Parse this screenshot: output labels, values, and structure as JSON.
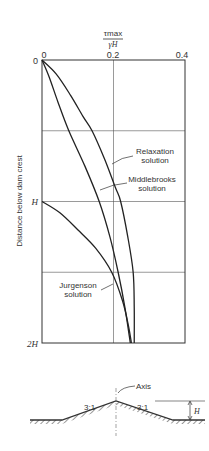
{
  "chart_data": {
    "type": "line",
    "title": "",
    "xlabel_numerator": "τmax",
    "xlabel_denominator": "γH",
    "ylabel": "Distance below dam crest",
    "xlim": [
      0,
      0.4
    ],
    "ylim": [
      0,
      2
    ],
    "y_unit": "H",
    "x_ticks": [
      "0",
      "0.2",
      "0.4"
    ],
    "y_ticks": [
      "0",
      "H",
      "2H"
    ],
    "grid": true,
    "series": [
      {
        "name": "Relaxation solution",
        "label_lines": [
          "Relaxation",
          "solution"
        ],
        "points": [
          [
            0,
            0
          ],
          [
            0.04,
            0.1
          ],
          [
            0.08,
            0.25
          ],
          [
            0.115,
            0.4
          ],
          [
            0.14,
            0.5
          ],
          [
            0.175,
            0.7
          ],
          [
            0.205,
            0.9
          ],
          [
            0.22,
            1.0
          ],
          [
            0.24,
            1.25
          ],
          [
            0.255,
            1.5
          ],
          [
            0.258,
            1.75
          ],
          [
            0.258,
            2.0
          ]
        ]
      },
      {
        "name": "Middlebrooks solution",
        "label_lines": [
          "Middlebrooks",
          "solution"
        ],
        "points": [
          [
            0,
            0
          ],
          [
            0.02,
            0.12
          ],
          [
            0.045,
            0.3
          ],
          [
            0.075,
            0.5
          ],
          [
            0.12,
            0.75
          ],
          [
            0.16,
            1.0
          ],
          [
            0.19,
            1.25
          ],
          [
            0.213,
            1.5
          ],
          [
            0.232,
            1.75
          ],
          [
            0.247,
            2.0
          ]
        ]
      },
      {
        "name": "Jurgenson solution",
        "label_lines": [
          "Jurgenson",
          "solution"
        ],
        "points": [
          [
            0,
            1.0
          ],
          [
            0.05,
            1.08
          ],
          [
            0.1,
            1.2
          ],
          [
            0.15,
            1.33
          ],
          [
            0.195,
            1.5
          ],
          [
            0.225,
            1.7
          ],
          [
            0.242,
            1.88
          ],
          [
            0.25,
            2.0
          ]
        ]
      }
    ]
  },
  "diagram": {
    "axis_label": "Axis",
    "slope_left": "3:1",
    "slope_right": "3:1",
    "height_label": "H"
  }
}
